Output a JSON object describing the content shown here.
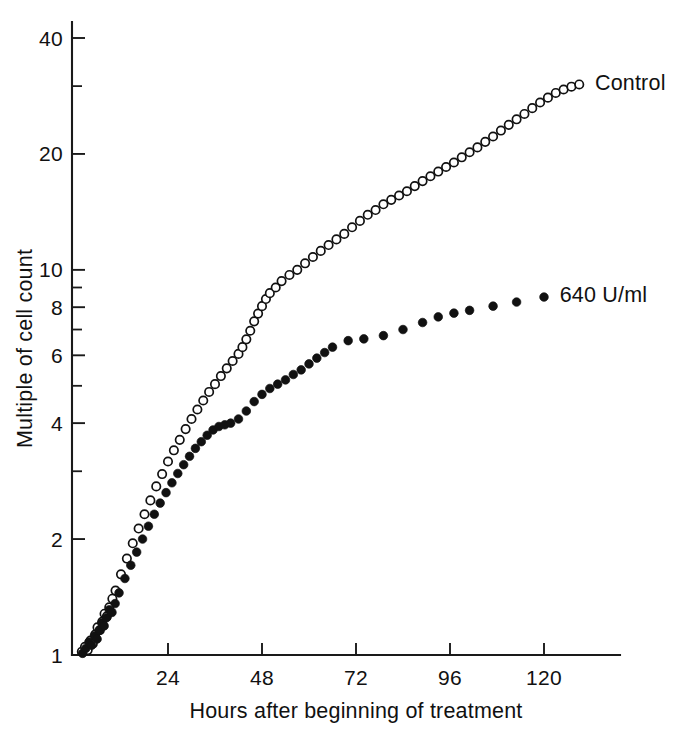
{
  "chart_data": {
    "type": "scatter",
    "title": "",
    "xlabel": "Hours after beginning of treatment",
    "ylabel": "Multiple of cell count",
    "yscale": "log",
    "xscale": "linear",
    "xlim": [
      0,
      138
    ],
    "ylim": [
      1,
      46
    ],
    "grid": false,
    "legend_position": "inline-right",
    "x_ticks": [
      24,
      48,
      72,
      96,
      120
    ],
    "x_tick_labels": [
      "24",
      "48",
      "72",
      "96",
      "120"
    ],
    "y_ticks": [
      1,
      2,
      3,
      4,
      5,
      6,
      7,
      8,
      9,
      10,
      20,
      30,
      40
    ],
    "y_tick_labels_shown": [
      "1",
      "2",
      "4",
      "6",
      "8",
      "10",
      "20",
      "40"
    ],
    "y_minor_ticks_unlabeled": [
      3,
      5,
      7,
      9,
      30
    ],
    "series": [
      {
        "name": "Control",
        "marker": "open-circle",
        "color": "#111111",
        "label_text": "Control",
        "points": [
          [
            2.0,
            1.02
          ],
          [
            2.8,
            1.05
          ],
          [
            3.5,
            1.03
          ],
          [
            4.2,
            1.09
          ],
          [
            4.8,
            1.07
          ],
          [
            5.4,
            1.13
          ],
          [
            6.0,
            1.18
          ],
          [
            6.6,
            1.16
          ],
          [
            7.2,
            1.22
          ],
          [
            7.8,
            1.28
          ],
          [
            8.4,
            1.26
          ],
          [
            9.0,
            1.33
          ],
          [
            9.8,
            1.4
          ],
          [
            10.6,
            1.47
          ],
          [
            12.0,
            1.62
          ],
          [
            13.5,
            1.78
          ],
          [
            15.0,
            1.95
          ],
          [
            16.5,
            2.13
          ],
          [
            18.0,
            2.32
          ],
          [
            19.5,
            2.52
          ],
          [
            21.0,
            2.74
          ],
          [
            22.5,
            2.95
          ],
          [
            24.0,
            3.18
          ],
          [
            25.5,
            3.4
          ],
          [
            27.0,
            3.62
          ],
          [
            28.5,
            3.86
          ],
          [
            30.0,
            4.1
          ],
          [
            31.5,
            4.34
          ],
          [
            33.0,
            4.58
          ],
          [
            34.5,
            4.82
          ],
          [
            36.0,
            5.05
          ],
          [
            37.5,
            5.3
          ],
          [
            39.0,
            5.55
          ],
          [
            40.5,
            5.8
          ],
          [
            42.0,
            6.05
          ],
          [
            43.0,
            6.3
          ],
          [
            44.0,
            6.6
          ],
          [
            45.0,
            6.95
          ],
          [
            46.0,
            7.35
          ],
          [
            47.0,
            7.7
          ],
          [
            48.0,
            8.05
          ],
          [
            49.0,
            8.4
          ],
          [
            50.0,
            8.7
          ],
          [
            51.5,
            9.0
          ],
          [
            53.0,
            9.35
          ],
          [
            55.0,
            9.7
          ],
          [
            57.0,
            10.0
          ],
          [
            59.0,
            10.4
          ],
          [
            61.0,
            10.8
          ],
          [
            63.0,
            11.2
          ],
          [
            65.0,
            11.6
          ],
          [
            67.0,
            12.0
          ],
          [
            69.0,
            12.4
          ],
          [
            71.0,
            12.9
          ],
          [
            73.0,
            13.4
          ],
          [
            75.0,
            13.9
          ],
          [
            77.0,
            14.3
          ],
          [
            79.0,
            14.8
          ],
          [
            81.0,
            15.2
          ],
          [
            83.0,
            15.6
          ],
          [
            85.0,
            16.0
          ],
          [
            87.0,
            16.5
          ],
          [
            89.0,
            17.0
          ],
          [
            91.0,
            17.5
          ],
          [
            93.0,
            18.0
          ],
          [
            95.0,
            18.5
          ],
          [
            97.0,
            19.0
          ],
          [
            99.0,
            19.6
          ],
          [
            101.0,
            20.2
          ],
          [
            103.0,
            20.8
          ],
          [
            105.0,
            21.5
          ],
          [
            107.0,
            22.2
          ],
          [
            109.0,
            23.0
          ],
          [
            111.0,
            23.8
          ],
          [
            113.0,
            24.6
          ],
          [
            115.0,
            25.4
          ],
          [
            117.0,
            26.3
          ],
          [
            119.0,
            27.2
          ],
          [
            121.0,
            28.0
          ],
          [
            123.0,
            28.8
          ],
          [
            125.0,
            29.4
          ],
          [
            127.0,
            29.9
          ],
          [
            129.0,
            30.3
          ]
        ]
      },
      {
        "name": "640 U/ml",
        "marker": "filled-circle",
        "color": "#111111",
        "label_text": "640 U/ml",
        "points": [
          [
            2.2,
            1.01
          ],
          [
            3.0,
            1.04
          ],
          [
            3.8,
            1.08
          ],
          [
            4.5,
            1.06
          ],
          [
            5.2,
            1.12
          ],
          [
            5.9,
            1.1
          ],
          [
            6.5,
            1.16
          ],
          [
            7.1,
            1.21
          ],
          [
            7.7,
            1.19
          ],
          [
            8.3,
            1.25
          ],
          [
            9.0,
            1.31
          ],
          [
            9.7,
            1.29
          ],
          [
            10.5,
            1.36
          ],
          [
            11.5,
            1.45
          ],
          [
            13.0,
            1.58
          ],
          [
            14.5,
            1.71
          ],
          [
            16.0,
            1.85
          ],
          [
            17.5,
            2.0
          ],
          [
            19.0,
            2.16
          ],
          [
            20.5,
            2.32
          ],
          [
            22.0,
            2.48
          ],
          [
            23.5,
            2.64
          ],
          [
            25.0,
            2.8
          ],
          [
            26.5,
            2.96
          ],
          [
            28.0,
            3.12
          ],
          [
            29.5,
            3.28
          ],
          [
            31.0,
            3.44
          ],
          [
            32.5,
            3.58
          ],
          [
            34.0,
            3.72
          ],
          [
            35.5,
            3.84
          ],
          [
            37.0,
            3.92
          ],
          [
            38.5,
            3.96
          ],
          [
            40.0,
            4.0
          ],
          [
            42.0,
            4.1
          ],
          [
            44.0,
            4.3
          ],
          [
            46.0,
            4.55
          ],
          [
            48.0,
            4.75
          ],
          [
            50.0,
            4.92
          ],
          [
            52.0,
            5.05
          ],
          [
            54.0,
            5.18
          ],
          [
            56.0,
            5.35
          ],
          [
            58.0,
            5.5
          ],
          [
            60.0,
            5.7
          ],
          [
            62.0,
            5.9
          ],
          [
            64.0,
            6.1
          ],
          [
            66.0,
            6.3
          ],
          [
            70.0,
            6.55
          ],
          [
            74.0,
            6.62
          ],
          [
            79.0,
            6.75
          ],
          [
            84.0,
            7.0
          ],
          [
            89.0,
            7.3
          ],
          [
            93.0,
            7.55
          ],
          [
            97.0,
            7.72
          ],
          [
            101.0,
            7.85
          ],
          [
            107.0,
            8.05
          ],
          [
            113.0,
            8.25
          ],
          [
            120.0,
            8.5
          ]
        ]
      }
    ],
    "annotations": [
      {
        "text": "Control",
        "x": 133,
        "y": 30.5
      },
      {
        "text": "640 U/ml",
        "x": 124,
        "y": 8.6
      }
    ]
  }
}
